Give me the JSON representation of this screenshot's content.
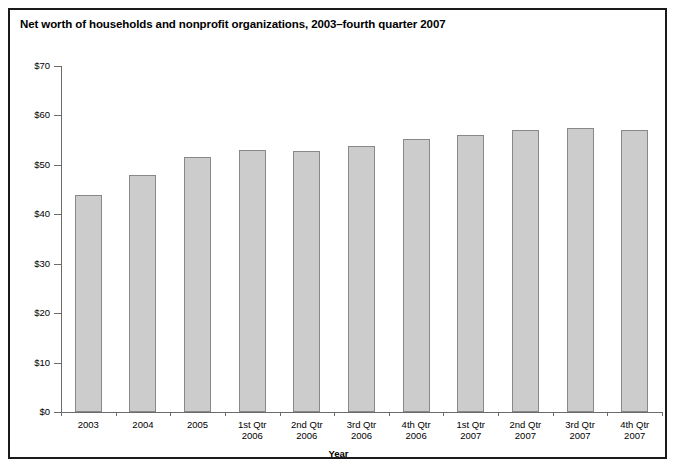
{
  "chart_data": {
    "type": "bar",
    "title": "Net worth of households and nonprofit organizations, 2003–fourth quarter 2007",
    "xlabel": "Year",
    "ylabel": "Trillions of dollars",
    "categories": [
      "2003",
      "2004",
      "2005",
      "1st Qtr 2006",
      "2nd Qtr 2006",
      "3rd Qtr 2006",
      "4th Qtr 2006",
      "1st Qtr 2007",
      "2nd Qtr 2007",
      "3rd Qtr 2007",
      "4th Qtr 2007"
    ],
    "category_lines": [
      [
        "2003",
        ""
      ],
      [
        "2004",
        ""
      ],
      [
        "2005",
        ""
      ],
      [
        "1st Qtr",
        "2006"
      ],
      [
        "2nd Qtr",
        "2006"
      ],
      [
        "3rd Qtr",
        "2006"
      ],
      [
        "4th Qtr",
        "2006"
      ],
      [
        "1st Qtr",
        "2007"
      ],
      [
        "2nd Qtr",
        "2007"
      ],
      [
        "3rd Qtr",
        "2007"
      ],
      [
        "4th Qtr",
        "2007"
      ]
    ],
    "values": [
      44.0,
      48.0,
      51.6,
      53.0,
      52.9,
      53.9,
      55.3,
      56.0,
      57.0,
      57.5,
      57.0
    ],
    "ylim": [
      0,
      70
    ],
    "ytick_values": [
      0,
      10,
      20,
      30,
      40,
      50,
      60,
      70
    ],
    "ytick_labels": [
      "$0",
      "$10",
      "$20",
      "$30",
      "$40",
      "$50",
      "$60",
      "$70"
    ],
    "grid": false,
    "legend": null,
    "bar_color": "#cccccc",
    "bar_edge_color": "#888888",
    "axis_color": "#6b6b6b",
    "frame_color": "#1a1a1a"
  }
}
